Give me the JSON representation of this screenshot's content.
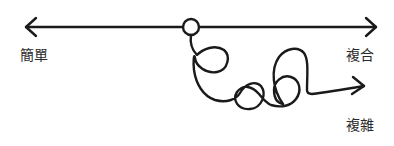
{
  "diagram": {
    "title": "",
    "labels": {
      "simple": "簡單",
      "complicated": "複合",
      "complex": "複雜"
    },
    "colors": {
      "stroke": "#1a1a1a",
      "text": "#2a2a2a",
      "background": "#ffffff"
    },
    "elements": [
      {
        "id": "axis-line",
        "type": "double-arrow",
        "from": "left (簡單)",
        "to": "right (複合)"
      },
      {
        "id": "origin-node",
        "type": "circle"
      },
      {
        "id": "tangled-path",
        "type": "looping-arrow",
        "to": "複雜"
      }
    ]
  }
}
